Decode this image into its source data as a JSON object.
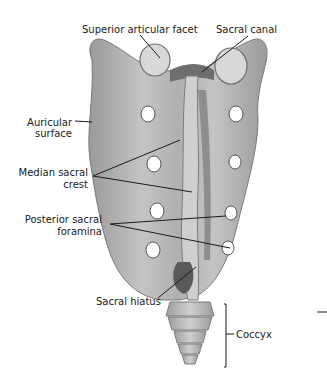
{
  "labels": {
    "superior_articular_facet": "Superior articular facet",
    "sacral_canal": "Sacral canal",
    "auricular_surface_1": "Auricular",
    "auricular_surface_2": "surface",
    "median_sacral_crest_1": "Median sacral",
    "median_sacral_crest_2": "crest",
    "posterior_sacral_foramina_1": "Posterior sacral",
    "posterior_sacral_foramina_2": "foramina",
    "sacral_hiatus": "Sacral hiatus",
    "coccyx": "Coccyx"
  },
  "colors": {
    "bone_fill": "#b9b9b9",
    "bone_shadow": "#8a8a8a",
    "bone_light": "#d9d9d9",
    "foramen": "#ffffff",
    "line": "#1a1a1a"
  }
}
